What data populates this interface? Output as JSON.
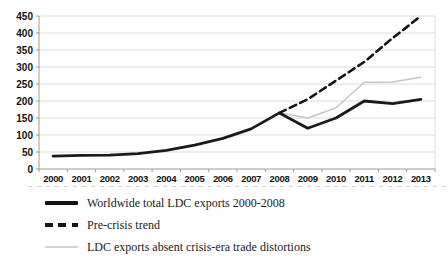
{
  "chart_data": {
    "type": "line",
    "title": "",
    "xlabel": "",
    "ylabel": "",
    "x": [
      2000,
      2001,
      2002,
      2003,
      2004,
      2005,
      2006,
      2007,
      2008,
      2009,
      2010,
      2011,
      2012,
      2013
    ],
    "ylim": [
      0,
      450
    ],
    "ytick_step": 50,
    "grid": true,
    "legend_position": "bottom",
    "series": [
      {
        "name": "Worldwide total LDC exports 2000-2008",
        "style": "solid-thick",
        "color": "#1a1a1a",
        "values": [
          38,
          40,
          41,
          45,
          55,
          70,
          90,
          118,
          165,
          120,
          150,
          200,
          192,
          205
        ]
      },
      {
        "name": "Pre-crisis trend",
        "style": "dashed",
        "color": "#141414",
        "values": [
          null,
          null,
          null,
          null,
          null,
          null,
          null,
          null,
          165,
          205,
          260,
          315,
          385,
          450
        ]
      },
      {
        "name": "LDC exports absent crisis-era trade distortions",
        "style": "solid-thin",
        "color": "#c4c4c4",
        "values": [
          null,
          null,
          null,
          null,
          null,
          null,
          null,
          null,
          165,
          150,
          180,
          255,
          256,
          270
        ]
      }
    ]
  },
  "colors": {
    "gridline": "#dcdcdc",
    "axis": "#9b9b9b",
    "tick_text": "#111111",
    "background": "#ffffff"
  }
}
